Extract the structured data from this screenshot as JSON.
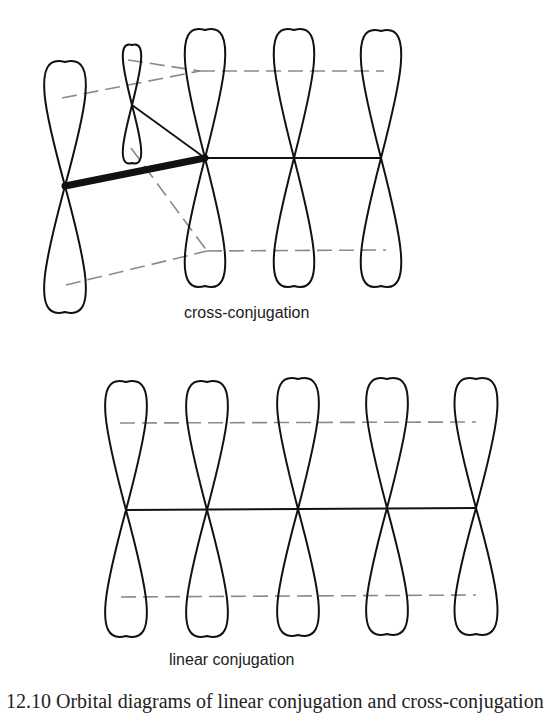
{
  "figure": {
    "labels": {
      "cross": "cross-conjugation",
      "linear": "linear conjugation"
    },
    "caption": "12.10   Orbital diagrams of linear conjugation and cross-conjugation"
  },
  "diagrams": {
    "cross_conjugation": {
      "orbitals": [
        {
          "node": [
            65,
            186
          ],
          "top": 62,
          "bottom": 312,
          "half_width": 34
        },
        {
          "node": [
            132,
            105
          ],
          "top": 45,
          "bottom": 163,
          "half_width": 15
        },
        {
          "node": [
            205,
            158
          ],
          "top": 30,
          "bottom": 286,
          "half_width": 33
        },
        {
          "node": [
            294,
            158
          ],
          "top": 30,
          "bottom": 286,
          "half_width": 33
        },
        {
          "node": [
            381,
            158
          ],
          "top": 31,
          "bottom": 286,
          "half_width": 33
        }
      ],
      "bonds": {
        "thick": [
          [
            65,
            186,
            205,
            158
          ]
        ],
        "thin": [
          [
            132,
            105,
            205,
            158
          ],
          [
            205,
            158,
            381,
            158
          ]
        ]
      },
      "dashed": [
        [
          62,
          98,
          200,
          71
        ],
        [
          128,
          60,
          200,
          71
        ],
        [
          200,
          71,
          384,
          71
        ],
        [
          66,
          285,
          207,
          251
        ],
        [
          131,
          148,
          207,
          251
        ],
        [
          207,
          251,
          386,
          250
        ]
      ]
    },
    "linear_conjugation": {
      "orbitals": [
        {
          "node": [
            126,
            510
          ],
          "top": 382,
          "bottom": 636,
          "half_width": 34
        },
        {
          "node": [
            207,
            510
          ],
          "top": 382,
          "bottom": 636,
          "half_width": 34
        },
        {
          "node": [
            298,
            509
          ],
          "top": 379,
          "bottom": 635,
          "half_width": 34
        },
        {
          "node": [
            387,
            508
          ],
          "top": 379,
          "bottom": 634,
          "half_width": 34
        },
        {
          "node": [
            476,
            508
          ],
          "top": 379,
          "bottom": 634,
          "half_width": 35
        }
      ],
      "bonds": {
        "thin": [
          [
            126,
            510,
            476,
            508
          ]
        ]
      },
      "dashed": [
        [
          120,
          423,
          476,
          422
        ],
        [
          121,
          597,
          476,
          595
        ]
      ]
    }
  }
}
